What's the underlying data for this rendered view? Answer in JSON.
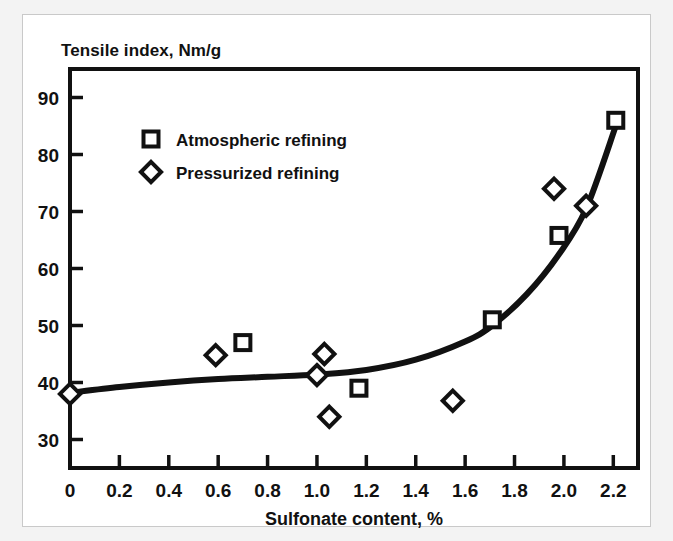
{
  "figure": {
    "ylabel_text": "Tensile index, Nm/g",
    "background_color": "#ffffff",
    "outer_color": "#f3f3f3",
    "ink_color": "#111111"
  },
  "chart_data": {
    "type": "scatter",
    "title": "",
    "subtitle": "",
    "xlabel": "Sulfonate content, %",
    "ylabel": "Tensile index, Nm/g",
    "xlim": [
      0,
      2.3
    ],
    "ylim": [
      25,
      95
    ],
    "xticks": [
      0,
      0.2,
      0.4,
      0.6,
      0.8,
      1.0,
      1.2,
      1.4,
      1.6,
      1.8,
      2.0,
      2.2
    ],
    "xtick_labels": [
      "0",
      "0.2",
      "0.4",
      "0.6",
      "0.8",
      "1.0",
      "1.2",
      "1.4",
      "1.6",
      "1.8",
      "2.0",
      "2.2"
    ],
    "yticks": [
      30,
      40,
      50,
      60,
      70,
      80,
      90
    ],
    "ytick_labels": [
      "30",
      "40",
      "50",
      "60",
      "70",
      "80",
      "90"
    ],
    "grid": false,
    "legend_position": "upper-left-inside",
    "series": [
      {
        "name": "Atmospheric refining",
        "marker": "square",
        "points": [
          {
            "x": 0.7,
            "y": 47.0
          },
          {
            "x": 1.17,
            "y": 39.0
          },
          {
            "x": 1.71,
            "y": 51.0
          },
          {
            "x": 1.98,
            "y": 65.8
          },
          {
            "x": 2.21,
            "y": 86.0
          }
        ]
      },
      {
        "name": "Pressurized refining",
        "marker": "diamond",
        "points": [
          {
            "x": 0.0,
            "y": 38.0
          },
          {
            "x": 0.59,
            "y": 44.8
          },
          {
            "x": 1.0,
            "y": 41.3
          },
          {
            "x": 1.03,
            "y": 45.0
          },
          {
            "x": 1.05,
            "y": 34.0
          },
          {
            "x": 1.55,
            "y": 36.8
          },
          {
            "x": 1.96,
            "y": 74.0
          },
          {
            "x": 2.09,
            "y": 71.0
          }
        ]
      }
    ],
    "fit_curve": {
      "name": "trend",
      "points": [
        {
          "x": 0.0,
          "y": 38.2
        },
        {
          "x": 0.2,
          "y": 39.2
        },
        {
          "x": 0.4,
          "y": 40.0
        },
        {
          "x": 0.6,
          "y": 40.6
        },
        {
          "x": 0.8,
          "y": 41.0
        },
        {
          "x": 1.0,
          "y": 41.4
        },
        {
          "x": 1.2,
          "y": 42.2
        },
        {
          "x": 1.4,
          "y": 44.0
        },
        {
          "x": 1.6,
          "y": 47.2
        },
        {
          "x": 1.71,
          "y": 50.0
        },
        {
          "x": 1.85,
          "y": 55.5
        },
        {
          "x": 1.98,
          "y": 62.5
        },
        {
          "x": 2.09,
          "y": 70.5
        },
        {
          "x": 2.21,
          "y": 85.0
        }
      ]
    }
  },
  "legend": {
    "entries": [
      {
        "label": "Atmospheric refining",
        "marker": "square"
      },
      {
        "label": "Pressurized refining",
        "marker": "diamond"
      }
    ]
  }
}
